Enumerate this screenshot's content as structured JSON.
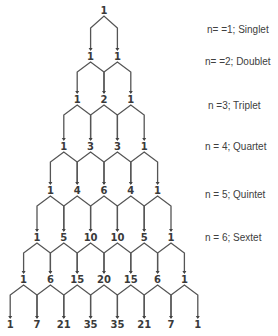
{
  "diagram": {
    "type": "pascal-triangle-multiplicity",
    "rows": [
      [
        1
      ],
      [
        1,
        1
      ],
      [
        1,
        2,
        1
      ],
      [
        1,
        3,
        3,
        1
      ],
      [
        1,
        4,
        6,
        4,
        1
      ],
      [
        1,
        5,
        10,
        10,
        5,
        1
      ],
      [
        1,
        6,
        15,
        20,
        15,
        6,
        1
      ],
      [
        1,
        7,
        21,
        35,
        35,
        21,
        7,
        1
      ]
    ],
    "labels": [
      {
        "text": "n= =1; Singlet",
        "y": 31
      },
      {
        "text": "n= =2; Doublet",
        "y": 63
      },
      {
        "text": "n =3; Triplet",
        "y": 107
      },
      {
        "text": "n = 4; Quartet",
        "y": 148
      },
      {
        "text": "n = 5; Quintet",
        "y": 196
      },
      {
        "text": "n = 6; Sextet",
        "y": 239
      }
    ],
    "colors": {
      "number": "#3a3a3a",
      "line": "#555555",
      "label": "#404040"
    }
  }
}
